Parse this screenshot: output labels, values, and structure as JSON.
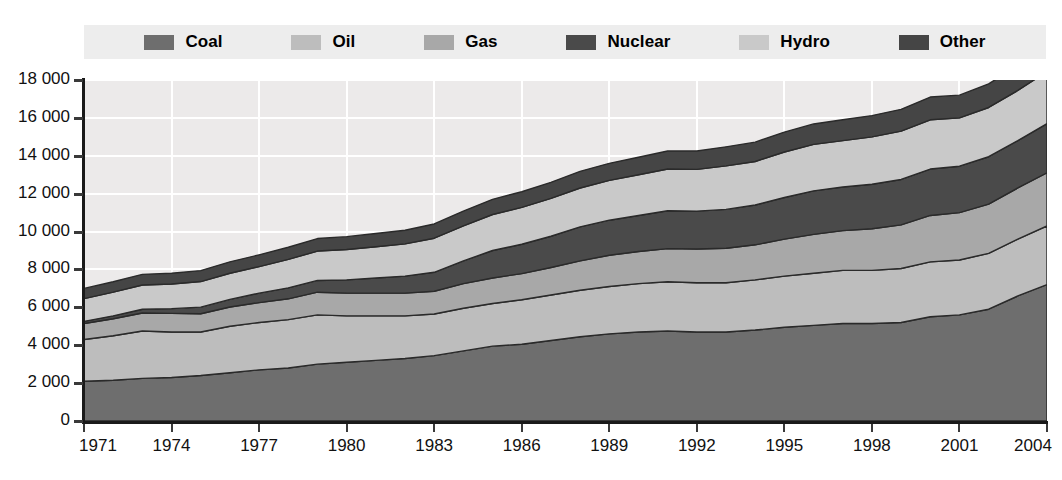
{
  "legend": {
    "position": "top",
    "items": [
      {
        "label": "Coal",
        "color": "#6e6e6e",
        "key": "coal"
      },
      {
        "label": "Oil",
        "color": "#bdbdbd",
        "key": "oil"
      },
      {
        "label": "Gas",
        "color": "#a8a8a8",
        "key": "gas"
      },
      {
        "label": "Nuclear",
        "color": "#4a4a4a",
        "key": "nuclear"
      },
      {
        "label": "Hydro",
        "color": "#c9c9c9",
        "key": "hydro"
      },
      {
        "label": "Other",
        "color": "#454545",
        "key": "other"
      }
    ]
  },
  "axes": {
    "y": {
      "ticks": [
        "18 000",
        "16 000",
        "14 000",
        "12 000",
        "10 000",
        "8 000",
        "6 000",
        "4 000",
        "2 000",
        "0"
      ],
      "min": 0,
      "max": 18000,
      "step": 2000
    },
    "x": {
      "ticks": [
        "1971",
        "1974",
        "1977",
        "1980",
        "1983",
        "1986",
        "1989",
        "1992",
        "1995",
        "1998",
        "2001",
        "2004"
      ],
      "min": 1971,
      "max": 2004
    }
  },
  "colors": {
    "plot_background": "#eceaea",
    "gridline": "#ffffff",
    "axis": "#1a1a1a",
    "legend_background": "#ededed",
    "page_background": "#ffffff",
    "band_outline": "#2a2a2a"
  },
  "chart_data": {
    "type": "area",
    "stacked": true,
    "title": "",
    "subtitle": "",
    "xlabel": "",
    "ylabel": "",
    "xlim": [
      1971,
      2004
    ],
    "ylim": [
      0,
      18000
    ],
    "grid": true,
    "legend_position": "top",
    "x": [
      1971,
      1972,
      1973,
      1974,
      1975,
      1976,
      1977,
      1978,
      1979,
      1980,
      1981,
      1982,
      1983,
      1984,
      1985,
      1986,
      1987,
      1988,
      1989,
      1990,
      1991,
      1992,
      1993,
      1994,
      1995,
      1996,
      1997,
      1998,
      1999,
      2000,
      2001,
      2002,
      2003,
      2004
    ],
    "series": [
      {
        "name": "Coal",
        "color": "#6e6e6e",
        "values": [
          2100,
          2150,
          2250,
          2300,
          2400,
          2550,
          2700,
          2800,
          3000,
          3100,
          3200,
          3300,
          3450,
          3700,
          3950,
          4050,
          4250,
          4450,
          4600,
          4700,
          4750,
          4700,
          4700,
          4800,
          4950,
          5050,
          5150,
          5150,
          5200,
          5500,
          5600,
          5900,
          6600,
          7200
        ]
      },
      {
        "name": "Oil",
        "color": "#bdbdbd",
        "values": [
          2200,
          2350,
          2500,
          2400,
          2300,
          2450,
          2500,
          2550,
          2600,
          2450,
          2350,
          2250,
          2200,
          2250,
          2250,
          2350,
          2400,
          2450,
          2500,
          2550,
          2600,
          2600,
          2600,
          2650,
          2700,
          2750,
          2800,
          2800,
          2850,
          2900,
          2900,
          2950,
          3000,
          3100
        ]
      },
      {
        "name": "Gas",
        "color": "#a8a8a8",
        "values": [
          850,
          900,
          950,
          980,
          960,
          1020,
          1050,
          1100,
          1200,
          1200,
          1200,
          1200,
          1200,
          1300,
          1350,
          1380,
          1450,
          1550,
          1650,
          1700,
          1750,
          1780,
          1820,
          1850,
          1950,
          2050,
          2100,
          2200,
          2300,
          2450,
          2500,
          2600,
          2700,
          2800
        ]
      },
      {
        "name": "Nuclear",
        "color": "#4a4a4a",
        "values": [
          110,
          150,
          200,
          250,
          350,
          400,
          500,
          580,
          620,
          700,
          800,
          900,
          1000,
          1200,
          1450,
          1550,
          1650,
          1800,
          1850,
          1900,
          2000,
          2000,
          2050,
          2100,
          2200,
          2300,
          2300,
          2350,
          2400,
          2450,
          2450,
          2500,
          2500,
          2600
        ]
      },
      {
        "name": "Hydro",
        "color": "#c9c9c9",
        "values": [
          1200,
          1250,
          1280,
          1300,
          1350,
          1380,
          1400,
          1500,
          1550,
          1600,
          1650,
          1700,
          1800,
          1850,
          1900,
          1950,
          2000,
          2050,
          2100,
          2150,
          2200,
          2200,
          2300,
          2300,
          2400,
          2450,
          2450,
          2500,
          2550,
          2600,
          2550,
          2600,
          2650,
          2750
        ]
      },
      {
        "name": "Other",
        "color": "#454545",
        "values": [
          540,
          550,
          560,
          570,
          580,
          600,
          620,
          640,
          660,
          680,
          700,
          720,
          750,
          780,
          800,
          820,
          850,
          880,
          900,
          920,
          950,
          970,
          1000,
          1020,
          1050,
          1080,
          1100,
          1120,
          1150,
          1200,
          1200,
          1250,
          1300,
          1350
        ]
      }
    ],
    "totals": [
      5000,
      5350,
      5740,
      5800,
      5940,
      6400,
      6770,
      7170,
      7630,
      7730,
      7900,
      8070,
      8400,
      9080,
      9700,
      10100,
      10600,
      11180,
      11600,
      11920,
      12250,
      12250,
      12470,
      12720,
      13250,
      13680,
      13900,
      14120,
      14450,
      15100,
      15200,
      15800,
      16750,
      17800
    ]
  }
}
